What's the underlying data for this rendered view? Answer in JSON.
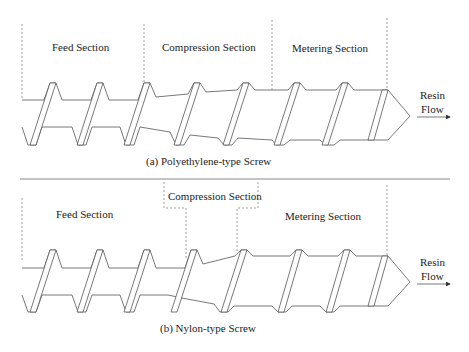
{
  "diagram": {
    "top": {
      "sections": [
        {
          "label": "Feed Section"
        },
        {
          "label": "Compression Section"
        },
        {
          "label": "Metering Section"
        }
      ],
      "flow_label_1": "Resin",
      "flow_label_2": "Flow",
      "caption": "(a) Polyethylene-type Screw"
    },
    "bottom": {
      "sections": [
        {
          "label": "Feed Section"
        },
        {
          "label": "Compression Section"
        },
        {
          "label": "Metering Section"
        }
      ],
      "flow_label_1": "Resin",
      "flow_label_2": "Flow",
      "caption": "(b) Nylon-type Screw"
    }
  }
}
